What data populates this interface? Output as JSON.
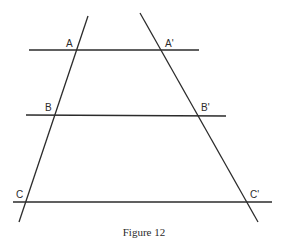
{
  "figure": {
    "caption": "Figure 12",
    "stroke_color": "#2b2b2b",
    "background": "#ffffff"
  },
  "lines": {
    "transversal_left": {
      "x1": 88,
      "y1": 16,
      "x2": 19,
      "y2": 222
    },
    "transversal_right": {
      "x1": 140,
      "y1": 13,
      "x2": 258,
      "y2": 222
    },
    "parallel_top": {
      "x1": 29,
      "y1": 50,
      "x2": 199,
      "y2": 50
    },
    "parallel_middle": {
      "x1": 26,
      "y1": 115,
      "x2": 226,
      "y2": 116
    },
    "parallel_bottom": {
      "x1": 13,
      "y1": 202,
      "x2": 272,
      "y2": 202
    }
  },
  "points": [
    {
      "id": "A",
      "label": "A",
      "x": 77,
      "y": 50,
      "label_x": 66,
      "label_y": 47
    },
    {
      "id": "A_prime",
      "label": "A'",
      "x": 161,
      "y": 50,
      "label_x": 165,
      "label_y": 47
    },
    {
      "id": "B",
      "label": "B",
      "x": 55,
      "y": 115,
      "label_x": 45,
      "label_y": 111
    },
    {
      "id": "B_prime",
      "label": "B'",
      "x": 198,
      "y": 115,
      "label_x": 201,
      "label_y": 111
    },
    {
      "id": "C",
      "label": "C",
      "x": 25,
      "y": 202,
      "label_x": 16,
      "label_y": 198
    },
    {
      "id": "C_prime",
      "label": "C'",
      "x": 248,
      "y": 202,
      "label_x": 250,
      "label_y": 198
    }
  ]
}
